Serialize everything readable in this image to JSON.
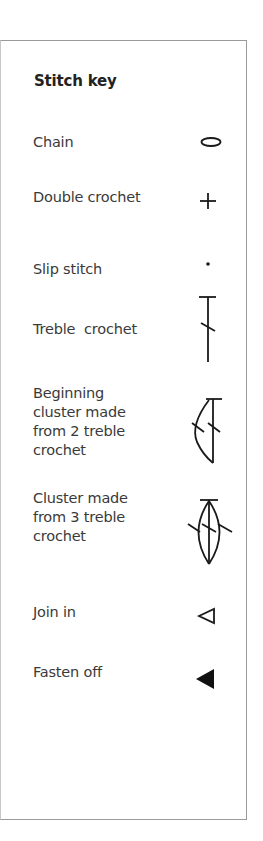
{
  "key": {
    "title": "Stitch key",
    "items": [
      {
        "label": "Chain",
        "icon": "chain-oval-icon"
      },
      {
        "label": "Double crochet",
        "icon": "double-crochet-plus-icon"
      },
      {
        "label": "Slip stitch",
        "icon": "slip-stitch-dot-icon"
      },
      {
        "label": "Treble  crochet",
        "icon": "treble-crochet-icon"
      },
      {
        "label": "Beginning\ncluster made\nfrom 2 treble\ncrochet",
        "icon": "beginning-cluster-icon"
      },
      {
        "label": "Cluster made\nfrom 3 treble\ncrochet",
        "icon": "cluster-3-treble-icon"
      },
      {
        "label": "Join in",
        "icon": "join-in-triangle-outline-icon"
      },
      {
        "label": "Fasten off",
        "icon": "fasten-off-triangle-filled-icon"
      }
    ]
  },
  "colors": {
    "border": "#9a9a9a",
    "text": "#3a3a3a",
    "symbol": "#1a1a1a"
  }
}
